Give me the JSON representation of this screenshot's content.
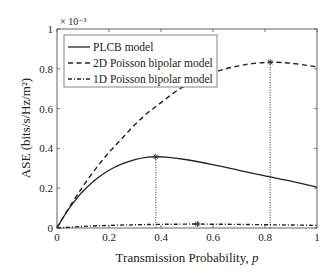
{
  "chart_data": {
    "type": "line",
    "title": "",
    "xlabel": "Transmission Probability, p",
    "xlabel_main": "Transmission Probability, ",
    "xlabel_var": "p",
    "ylabel": "ASE (bits/s/Hz/m²)",
    "y_multiplier": "× 10⁻³",
    "xlim": [
      0,
      1
    ],
    "ylim": [
      0,
      1
    ],
    "xticks": [
      0,
      0.2,
      0.4,
      0.6,
      0.8,
      1
    ],
    "xtick_labels": [
      "0",
      "0.2",
      "0.4",
      "0.6",
      "0.8",
      "1"
    ],
    "yticks": [
      0,
      0.2,
      0.4,
      0.6,
      0.8,
      1
    ],
    "ytick_labels": [
      "0",
      "0.2",
      "0.4",
      "0.6",
      "0.8",
      "1"
    ],
    "grid": false,
    "legend_position": "upper left",
    "series": [
      {
        "name": "PLCB model",
        "style": "solid",
        "x": [
          0,
          0.02,
          0.05,
          0.08,
          0.1,
          0.15,
          0.2,
          0.25,
          0.3,
          0.35,
          0.38,
          0.42,
          0.5,
          0.6,
          0.7,
          0.8,
          0.82,
          0.9,
          1.0
        ],
        "values": [
          0,
          0.045,
          0.105,
          0.155,
          0.185,
          0.245,
          0.29,
          0.322,
          0.344,
          0.356,
          0.358,
          0.356,
          0.343,
          0.318,
          0.29,
          0.262,
          0.257,
          0.235,
          0.205
        ],
        "marker": {
          "x": 0.38,
          "y": 0.358
        }
      },
      {
        "name": "2D Poisson bipolar model",
        "style": "dashed",
        "x": [
          0,
          0.02,
          0.05,
          0.08,
          0.1,
          0.15,
          0.2,
          0.25,
          0.3,
          0.35,
          0.4,
          0.45,
          0.5,
          0.55,
          0.6,
          0.65,
          0.7,
          0.75,
          0.82,
          0.9,
          1.0
        ],
        "values": [
          0,
          0.045,
          0.11,
          0.17,
          0.21,
          0.3,
          0.38,
          0.45,
          0.52,
          0.58,
          0.63,
          0.68,
          0.72,
          0.75,
          0.78,
          0.8,
          0.815,
          0.826,
          0.833,
          0.828,
          0.81
        ],
        "marker": {
          "x": 0.82,
          "y": 0.833
        }
      },
      {
        "name": "1D Poisson bipolar model",
        "style": "dashdot",
        "x": [
          0,
          0.1,
          0.2,
          0.3,
          0.38,
          0.45,
          0.54,
          0.6,
          0.7,
          0.82,
          0.9,
          1.0
        ],
        "values": [
          0,
          0.008,
          0.013,
          0.016,
          0.018,
          0.019,
          0.02,
          0.019,
          0.018,
          0.016,
          0.015,
          0.013
        ],
        "marker": {
          "x": 0.54,
          "y": 0.02
        }
      }
    ],
    "annotations": [
      {
        "type": "vertical-dotted-line",
        "x": 0.38,
        "from_y": 0,
        "to_y": 0.358
      },
      {
        "type": "vertical-dotted-line",
        "x": 0.82,
        "from_y": 0,
        "to_y": 0.833
      }
    ]
  }
}
